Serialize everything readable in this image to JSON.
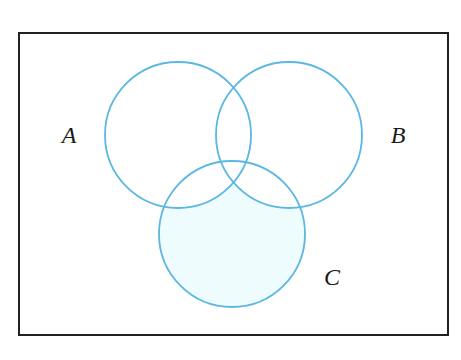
{
  "diagram": {
    "type": "venn",
    "universe": {
      "x": 19,
      "y": 33,
      "width": 429,
      "height": 302,
      "stroke": "#222222"
    },
    "sets": [
      {
        "id": "A",
        "label": "A",
        "cx": 178,
        "cy": 135,
        "r": 73,
        "label_x": 69,
        "label_y": 143
      },
      {
        "id": "B",
        "label": "B",
        "cx": 289,
        "cy": 135,
        "r": 73,
        "label_x": 398,
        "label_y": 143
      },
      {
        "id": "C",
        "label": "C",
        "cx": 232,
        "cy": 234,
        "r": 73,
        "label_x": 332,
        "label_y": 285
      }
    ],
    "shaded_region": "C minus (A union B)",
    "colors": {
      "circle_stroke": "#5BB8E0",
      "shade_fill": "#EEFCFE",
      "background": "#FFFFFF",
      "label": "#1A1A1A"
    }
  }
}
